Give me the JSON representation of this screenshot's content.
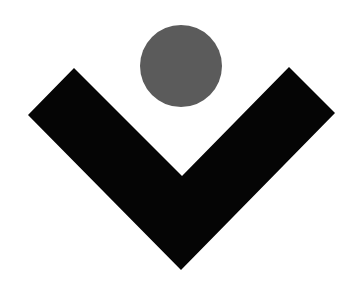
{
  "logo": {
    "description": "Abstract logo mark: gray circle above a black V-shaped chevron",
    "background_color": "#ffffff",
    "circle": {
      "color": "#5b5b5b",
      "cx": 181,
      "cy": 66,
      "r": 41
    },
    "chevron": {
      "color": "#050505",
      "points": "74,68 182,176 289,67 335,113 181,270 28,115"
    }
  }
}
